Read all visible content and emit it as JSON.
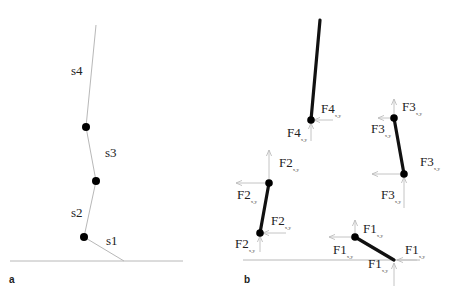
{
  "figure": {
    "panel_a": {
      "label": "a",
      "segments": [
        {
          "id": "s1",
          "label": "s1"
        },
        {
          "id": "s2",
          "label": "s2"
        },
        {
          "id": "s3",
          "label": "s3"
        },
        {
          "id": "s4",
          "label": "s4"
        }
      ]
    },
    "panel_b": {
      "label": "b",
      "forces": {
        "F4_top": {
          "main": "F4",
          "sub": "x,y"
        },
        "F4_bottom": {
          "main": "F4",
          "sub": "x,y"
        },
        "F3_top_a": {
          "main": "F3",
          "sub": "x,y"
        },
        "F3_top_b": {
          "main": "F3",
          "sub": "x,y"
        },
        "F3_bot_a": {
          "main": "F3",
          "sub": "x,y"
        },
        "F3_bot_b": {
          "main": "F3",
          "sub": "x,y"
        },
        "F2_top_a": {
          "main": "F2",
          "sub": "x,y"
        },
        "F2_top_b": {
          "main": "F2",
          "sub": "x,y"
        },
        "F2_bot_a": {
          "main": "F2",
          "sub": "x,y"
        },
        "F2_bot_b": {
          "main": "F2",
          "sub": "x,y"
        },
        "F1_top_a": {
          "main": "F1",
          "sub": "x,y"
        },
        "F1_top_b": {
          "main": "F1",
          "sub": "x,y"
        },
        "F1_bot_a": {
          "main": "F1",
          "sub": "x,y"
        },
        "F1_bot_b": {
          "main": "F1",
          "sub": "x,y"
        }
      }
    }
  }
}
